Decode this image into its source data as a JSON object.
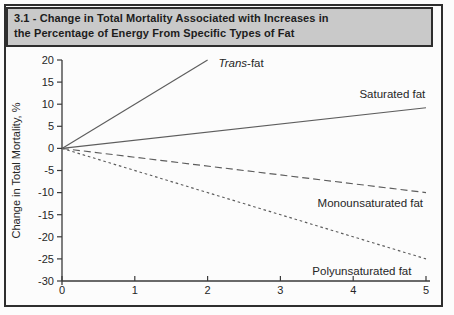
{
  "figure": {
    "header": {
      "line1": "3.1 - Change in Total Mortality Associated with Increases in",
      "line2": "the Percentage of Energy From Specific Types of Fat"
    },
    "colors": {
      "page_bg": "#fcfcfc",
      "header_bg": "#c9c9c9",
      "border": "#2e2e2e",
      "header_text": "#1d1d1d",
      "axis": "#3a3a3a",
      "line": "#5d5d5d",
      "label_text": "#262626"
    }
  },
  "chart_data": {
    "type": "line",
    "title": "3.1 - Change in Total Mortality Associated with Increases in the Percentage of Energy From Specific Types of Fat",
    "xlabel": "",
    "ylabel": "Change in Total Mortality, %",
    "xlim": [
      0,
      5
    ],
    "ylim": [
      -30,
      20
    ],
    "x_ticks": [
      0,
      1,
      2,
      3,
      4,
      5
    ],
    "y_ticks": [
      20,
      15,
      10,
      5,
      0,
      -5,
      -10,
      -15,
      -20,
      -25,
      -30
    ],
    "grid": false,
    "legend_position": "inline-labels",
    "series": [
      {
        "name": "Trans-fat",
        "x": [
          0,
          2
        ],
        "y": [
          0,
          20
        ],
        "line_style": "solid",
        "label_parts": [
          {
            "text": "Trans",
            "italic": true
          },
          {
            "text": "-fat",
            "italic": false
          }
        ],
        "label_x": 2.15,
        "label_y": 19.2,
        "label_align": "start"
      },
      {
        "name": "Saturated fat",
        "x": [
          0,
          5
        ],
        "y": [
          0,
          9.2
        ],
        "line_style": "solid",
        "label_parts": [
          {
            "text": "Saturated fat",
            "italic": false
          }
        ],
        "label_x": 4.99,
        "label_y": 12.3,
        "label_align": "end"
      },
      {
        "name": "Monounsaturated fat",
        "x": [
          0,
          5
        ],
        "y": [
          0,
          -10
        ],
        "line_style": "dash-long",
        "label_parts": [
          {
            "text": "Monounsaturated fat",
            "italic": false
          }
        ],
        "label_x": 4.96,
        "label_y": -12.3,
        "label_align": "end"
      },
      {
        "name": "Polyunsaturated fat",
        "x": [
          0,
          5
        ],
        "y": [
          0,
          -25
        ],
        "line_style": "dash-short",
        "label_parts": [
          {
            "text": "Polyunsaturated fat",
            "italic": false
          }
        ],
        "label_x": 4.8,
        "label_y": -27.8,
        "label_align": "end"
      }
    ]
  }
}
